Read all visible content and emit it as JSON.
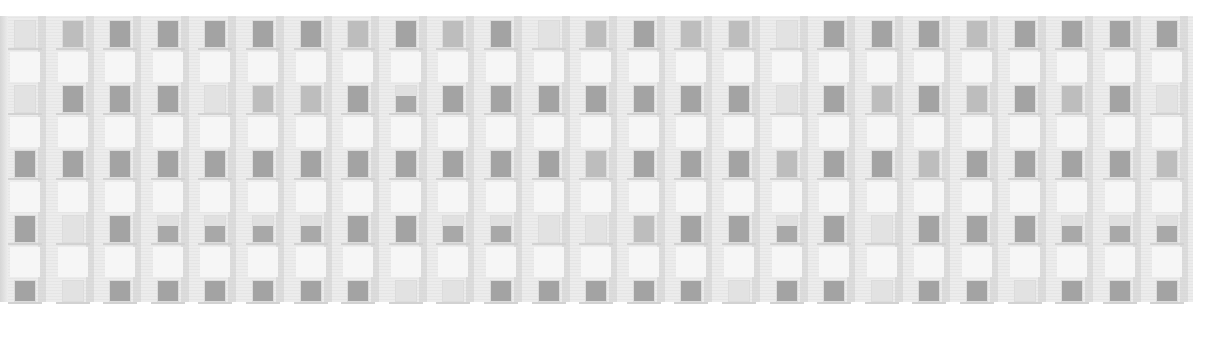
{
  "image": {
    "subject": "building facade with grid of windows",
    "tone": "grayscale",
    "columns": 25,
    "rows": 5,
    "colors": {
      "background": "#ffffff",
      "wall": "#ececec",
      "window_light": "#e2e2e2",
      "window_mid": "#bdbdbd",
      "window_dark": "#a3a3a3"
    },
    "window_shades": [
      [
        0,
        1,
        2,
        2,
        2,
        2,
        2,
        1,
        2,
        1,
        2,
        0,
        1,
        2,
        1,
        1,
        0,
        2,
        2,
        2,
        1,
        2,
        2,
        2,
        2
      ],
      [
        0,
        2,
        2,
        2,
        0,
        1,
        1,
        2,
        3,
        2,
        2,
        2,
        2,
        2,
        2,
        2,
        0,
        2,
        1,
        2,
        1,
        2,
        1,
        2,
        0
      ],
      [
        2,
        2,
        2,
        2,
        2,
        2,
        2,
        2,
        2,
        2,
        2,
        2,
        1,
        2,
        2,
        2,
        1,
        2,
        2,
        1,
        2,
        2,
        2,
        2,
        1
      ],
      [
        2,
        0,
        2,
        3,
        3,
        3,
        3,
        2,
        2,
        3,
        3,
        0,
        0,
        1,
        2,
        2,
        3,
        2,
        0,
        2,
        2,
        2,
        3,
        3,
        3
      ],
      [
        2,
        0,
        2,
        2,
        2,
        2,
        2,
        2,
        0,
        0,
        2,
        2,
        2,
        2,
        2,
        0,
        2,
        2,
        0,
        2,
        2,
        0,
        2,
        2,
        2
      ]
    ]
  }
}
